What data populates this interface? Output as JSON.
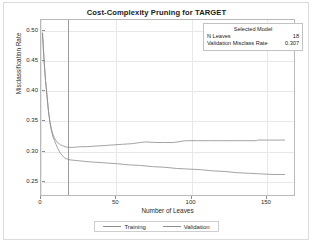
{
  "chart_data": {
    "type": "line",
    "title": "Cost-Complexity Pruning for TARGET",
    "xlabel": "Number of Leaves",
    "ylabel": "Misclassification Rate",
    "xlim": [
      0,
      168
    ],
    "ylim": [
      0.228,
      0.518
    ],
    "xticks": [
      "0",
      "50",
      "100",
      "150"
    ],
    "xtick_values": [
      0,
      50,
      100,
      150
    ],
    "yticks": [
      "0.50",
      "0.45",
      "0.40",
      "0.35",
      "0.30",
      "0.25"
    ],
    "ytick_values": [
      0.5,
      0.45,
      0.4,
      0.35,
      0.3,
      0.25
    ],
    "grid": true,
    "legend_position": "bottom",
    "reference_line_x": 18,
    "series": [
      {
        "name": "Training",
        "color": "#8c8c8c",
        "points": [
          [
            1,
            0.497
          ],
          [
            2,
            0.452
          ],
          [
            3,
            0.418
          ],
          [
            4,
            0.392
          ],
          [
            5,
            0.366
          ],
          [
            6,
            0.347
          ],
          [
            7,
            0.334
          ],
          [
            8,
            0.324
          ],
          [
            9,
            0.318
          ],
          [
            10,
            0.312
          ],
          [
            11,
            0.306
          ],
          [
            12,
            0.301
          ],
          [
            13,
            0.297
          ],
          [
            14,
            0.294
          ],
          [
            15,
            0.291
          ],
          [
            16,
            0.289
          ],
          [
            18,
            0.287
          ],
          [
            20,
            0.286
          ],
          [
            24,
            0.285
          ],
          [
            28,
            0.284
          ],
          [
            32,
            0.283
          ],
          [
            38,
            0.282
          ],
          [
            44,
            0.281
          ],
          [
            50,
            0.28
          ],
          [
            58,
            0.278
          ],
          [
            66,
            0.277
          ],
          [
            74,
            0.275
          ],
          [
            82,
            0.274
          ],
          [
            90,
            0.272
          ],
          [
            98,
            0.271
          ],
          [
            106,
            0.27
          ],
          [
            114,
            0.268
          ],
          [
            122,
            0.267
          ],
          [
            130,
            0.265
          ],
          [
            138,
            0.264
          ],
          [
            146,
            0.263
          ],
          [
            154,
            0.262
          ],
          [
            162,
            0.262
          ]
        ]
      },
      {
        "name": "Validation",
        "color": "#8c8c8c",
        "points": [
          [
            1,
            0.497
          ],
          [
            2,
            0.452
          ],
          [
            3,
            0.418
          ],
          [
            4,
            0.392
          ],
          [
            5,
            0.366
          ],
          [
            6,
            0.348
          ],
          [
            7,
            0.336
          ],
          [
            8,
            0.328
          ],
          [
            9,
            0.322
          ],
          [
            10,
            0.318
          ],
          [
            11,
            0.315
          ],
          [
            12,
            0.313
          ],
          [
            13,
            0.311
          ],
          [
            14,
            0.31
          ],
          [
            15,
            0.309
          ],
          [
            16,
            0.308
          ],
          [
            18,
            0.307
          ],
          [
            22,
            0.307
          ],
          [
            26,
            0.308
          ],
          [
            30,
            0.308
          ],
          [
            36,
            0.309
          ],
          [
            42,
            0.31
          ],
          [
            48,
            0.311
          ],
          [
            54,
            0.312
          ],
          [
            60,
            0.313
          ],
          [
            66,
            0.315
          ],
          [
            70,
            0.316
          ],
          [
            76,
            0.315
          ],
          [
            82,
            0.315
          ],
          [
            88,
            0.315
          ],
          [
            96,
            0.318
          ],
          [
            104,
            0.318
          ],
          [
            112,
            0.318
          ],
          [
            120,
            0.318
          ],
          [
            128,
            0.318
          ],
          [
            136,
            0.318
          ],
          [
            143,
            0.318
          ],
          [
            144,
            0.319
          ],
          [
            152,
            0.319
          ],
          [
            162,
            0.319
          ]
        ]
      }
    ]
  },
  "selected_model": {
    "title": "Selected Model",
    "rows": [
      {
        "label": "N Leaves",
        "value": "18"
      },
      {
        "label": "Validation Misclass Rate",
        "value": "0.307"
      }
    ]
  },
  "legend": {
    "entries": [
      {
        "label": "Training"
      },
      {
        "label": "Validation"
      }
    ]
  },
  "colors": {
    "line": "#8c8c8c",
    "grid": "#e8e8e8",
    "frame": "#b9b9b9",
    "refline": "#9a9a9a",
    "text": "#1f1f1f"
  }
}
